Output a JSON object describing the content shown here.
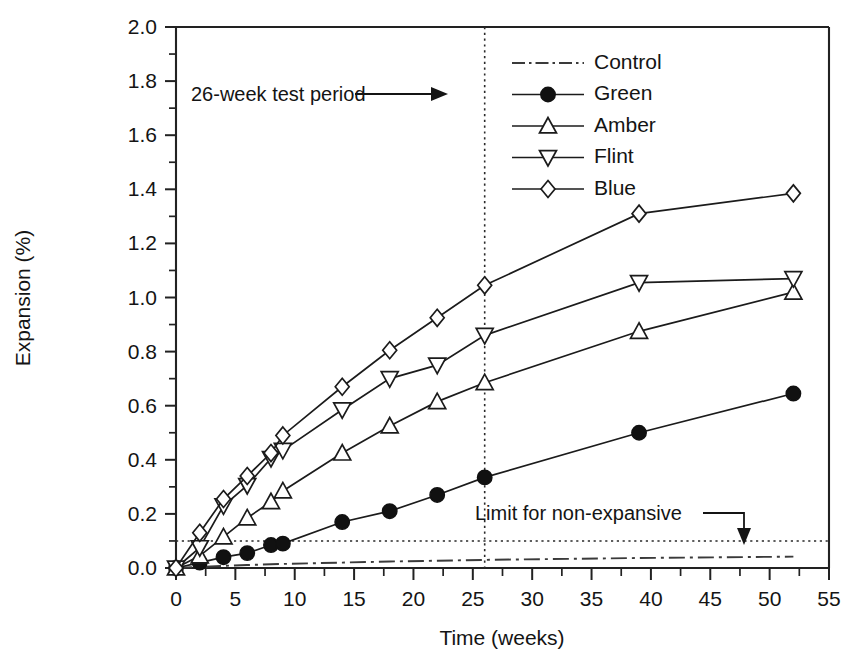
{
  "chart_data": {
    "type": "line",
    "title": "",
    "xlabel": "Time (weeks)",
    "ylabel": "Expansion (%)",
    "xlim": [
      0,
      55
    ],
    "ylim": [
      0.0,
      2.0
    ],
    "x_ticks": [
      0,
      5,
      10,
      15,
      20,
      25,
      30,
      35,
      40,
      45,
      50,
      55
    ],
    "x_tick_labels": [
      "0",
      "5",
      "10",
      "15",
      "20",
      "25",
      "30",
      "35",
      "40",
      "45",
      "50",
      "55"
    ],
    "x_minor_step": 1,
    "y_ticks": [
      0.0,
      0.2,
      0.4,
      0.6,
      0.8,
      1.0,
      1.2,
      1.4,
      1.6,
      1.8,
      2.0
    ],
    "y_tick_labels": [
      "0.0",
      "0.2",
      "0.4",
      "0.6",
      "0.8",
      "1.0",
      "1.2",
      "1.4",
      "1.6",
      "1.8",
      "2.0"
    ],
    "y_minor_step": 0.1,
    "grid": false,
    "legend_position": "top-right",
    "series": [
      {
        "name": "Control",
        "marker": "none",
        "linestyle": "dash-dot",
        "x": [
          0,
          2,
          4,
          6,
          9,
          14,
          18,
          22,
          26,
          39,
          52
        ],
        "values": [
          0.0,
          0.004,
          0.008,
          0.011,
          0.015,
          0.02,
          0.024,
          0.027,
          0.03,
          0.037,
          0.042
        ]
      },
      {
        "name": "Green",
        "marker": "filled-circle",
        "linestyle": "solid",
        "x": [
          0,
          2,
          4,
          6,
          8,
          9,
          14,
          18,
          22,
          26,
          39,
          52
        ],
        "values": [
          0.0,
          0.02,
          0.04,
          0.055,
          0.085,
          0.09,
          0.17,
          0.21,
          0.27,
          0.335,
          0.5,
          0.645
        ]
      },
      {
        "name": "Amber",
        "marker": "up-triangle",
        "linestyle": "solid",
        "x": [
          0,
          2,
          4,
          6,
          8,
          9,
          14,
          18,
          22,
          26,
          39,
          52
        ],
        "values": [
          0.0,
          0.045,
          0.115,
          0.185,
          0.245,
          0.285,
          0.425,
          0.525,
          0.615,
          0.685,
          0.875,
          1.02
        ]
      },
      {
        "name": "Flint",
        "marker": "down-triangle",
        "linestyle": "solid",
        "x": [
          0,
          2,
          4,
          6,
          8,
          9,
          14,
          18,
          22,
          26,
          39,
          52
        ],
        "values": [
          0.0,
          0.075,
          0.23,
          0.305,
          0.405,
          0.435,
          0.585,
          0.7,
          0.75,
          0.86,
          1.055,
          1.07
        ]
      },
      {
        "name": "Blue",
        "marker": "diamond",
        "linestyle": "solid",
        "x": [
          0,
          2,
          4,
          6,
          8,
          9,
          14,
          18,
          22,
          26,
          39,
          52
        ],
        "values": [
          0.0,
          0.13,
          0.255,
          0.34,
          0.425,
          0.49,
          0.67,
          0.805,
          0.925,
          1.045,
          1.31,
          1.385
        ]
      }
    ],
    "annotations": [
      {
        "id": "test-period",
        "text": "26-week test period",
        "points_to_x": 26,
        "line_type": "vertical-dotted",
        "line_value": 26
      },
      {
        "id": "non-expansive-limit",
        "text": "Limit for non-expansive",
        "points_to_y": 0.1,
        "line_type": "horizontal-dotted",
        "line_value": 0.1
      }
    ]
  },
  "legend": {
    "entries": [
      {
        "label": "Control"
      },
      {
        "label": "Green"
      },
      {
        "label": "Amber"
      },
      {
        "label": "Flint"
      },
      {
        "label": "Blue"
      }
    ]
  },
  "colors": {
    "ink": "#1a1a1a",
    "background": "#ffffff",
    "control_line": "#3a3a3a"
  }
}
